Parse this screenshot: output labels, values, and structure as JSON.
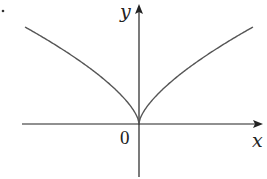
{
  "chart_data": {
    "type": "line",
    "title": "",
    "xlabel": "x",
    "ylabel": "y",
    "origin_label": "0",
    "series": [
      {
        "name": "curve",
        "x": [
          -1,
          -0.75,
          -0.5,
          -0.25,
          -0.1,
          0,
          0.1,
          0.25,
          0.5,
          0.75,
          1
        ],
        "values": [
          1,
          0.825,
          0.63,
          0.397,
          0.215,
          0,
          0.215,
          0.397,
          0.63,
          0.825,
          1
        ]
      }
    ],
    "grid": false,
    "legend": false
  },
  "labels": {
    "x_axis": "x",
    "y_axis": "y",
    "origin": "0"
  },
  "colors": {
    "axis": "#222222",
    "curve": "#555555"
  }
}
